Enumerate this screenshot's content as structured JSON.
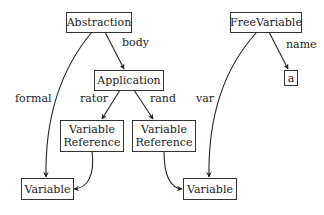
{
  "diagram": {
    "nodes": [
      {
        "id": "abstraction",
        "label": "Abstraction"
      },
      {
        "id": "application",
        "label": "Application"
      },
      {
        "id": "varref1",
        "label_line1": "Variable",
        "label_line2": "Reference"
      },
      {
        "id": "varref2",
        "label_line1": "Variable",
        "label_line2": "Reference"
      },
      {
        "id": "variable1",
        "label": "Variable"
      },
      {
        "id": "variable2",
        "label": "Variable"
      },
      {
        "id": "freevariable",
        "label": "FreeVariable"
      },
      {
        "id": "a",
        "label": "a"
      }
    ],
    "edges": [
      {
        "from": "abstraction",
        "to": "application",
        "label": "body"
      },
      {
        "from": "abstraction",
        "to": "variable1",
        "label": "formal"
      },
      {
        "from": "application",
        "to": "varref1",
        "label": "rator"
      },
      {
        "from": "application",
        "to": "varref2",
        "label": "rand"
      },
      {
        "from": "varref1",
        "to": "variable1",
        "label": ""
      },
      {
        "from": "varref2",
        "to": "variable2",
        "label": ""
      },
      {
        "from": "freevariable",
        "to": "variable2",
        "label": "var"
      },
      {
        "from": "freevariable",
        "to": "a",
        "label": "name"
      }
    ],
    "edge_labels": {
      "body": "body",
      "formal": "formal",
      "rator": "rator",
      "rand": "rand",
      "var": "var",
      "name": "name"
    }
  }
}
